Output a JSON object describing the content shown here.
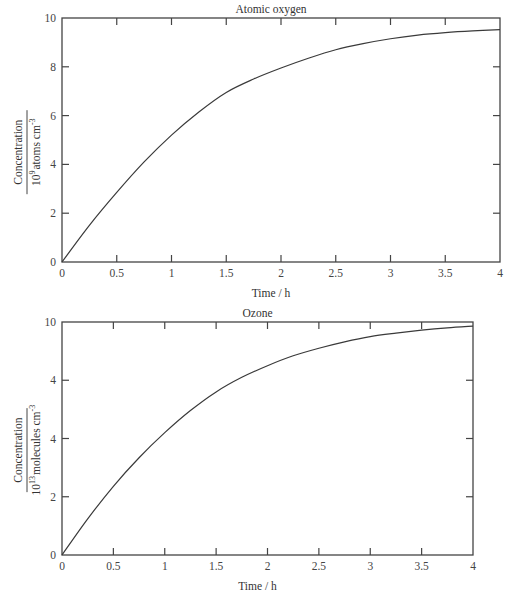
{
  "chart_data": [
    {
      "type": "line",
      "title": "Atomic oxygen",
      "xlabel": "Time / h",
      "ylabel_numerator": "Concentration",
      "ylabel_denominator": "10^9 atoms cm^-3",
      "ylabel_parts": {
        "base": "10",
        "exp": "9",
        "unit": "atoms cm",
        "unit_exp": "-3"
      },
      "xlim": [
        0,
        4
      ],
      "ylim": [
        0,
        10
      ],
      "x_ticks": [
        0,
        0.5,
        1,
        1.5,
        2,
        2.5,
        3,
        3.5,
        4
      ],
      "x_tick_labels": [
        "0",
        "0.5",
        "1",
        "1.5",
        "2",
        "2.5",
        "3",
        "3.5",
        "4"
      ],
      "y_ticks": [
        0,
        2,
        4,
        6,
        8,
        10
      ],
      "y_tick_labels": [
        "0",
        "2",
        "4",
        "6",
        "8",
        "10"
      ],
      "grid": false,
      "legend": null,
      "series": [
        {
          "name": "Atomic oxygen",
          "x": [
            0,
            0.25,
            0.5,
            0.75,
            1,
            1.25,
            1.5,
            1.75,
            2,
            2.25,
            2.5,
            2.75,
            3,
            3.25,
            3.5,
            3.75,
            4
          ],
          "y": [
            0,
            1.5,
            2.85,
            4.1,
            5.2,
            6.15,
            6.95,
            7.5,
            7.95,
            8.35,
            8.7,
            8.95,
            9.15,
            9.3,
            9.4,
            9.47,
            9.52
          ]
        }
      ]
    },
    {
      "type": "line",
      "title": "Ozone",
      "xlabel": "Time / h",
      "ylabel_numerator": "Concentration",
      "ylabel_denominator": "10^13 molecules cm^-3",
      "ylabel_parts": {
        "base": "10",
        "exp": "13",
        "unit": "molecules cm",
        "unit_exp": "-3"
      },
      "xlim": [
        0,
        4
      ],
      "ylim": [
        0,
        4
      ],
      "x_ticks": [
        0,
        0.5,
        1,
        1.5,
        2,
        2.5,
        3,
        3.5,
        4
      ],
      "x_tick_labels": [
        "0",
        "0.5",
        "1",
        "1.5",
        "2",
        "2.5",
        "3",
        "3.5",
        "4"
      ],
      "y_ticks": [
        0,
        1,
        2,
        3,
        4
      ],
      "y_tick_labels": [
        "0",
        "2",
        "4",
        "4",
        "10"
      ],
      "grid": false,
      "legend": null,
      "note": "y tick labels reproduced as printed (equally spaced ticks labelled 0, 2, 4, 4, 10)",
      "series": [
        {
          "name": "Ozone",
          "x": [
            0,
            0.25,
            0.5,
            0.75,
            1,
            1.25,
            1.5,
            1.75,
            2,
            2.25,
            2.5,
            2.75,
            3,
            3.25,
            3.5,
            3.75,
            4
          ],
          "y": [
            0,
            0.62,
            1.18,
            1.67,
            2.1,
            2.48,
            2.8,
            3.05,
            3.25,
            3.42,
            3.55,
            3.66,
            3.75,
            3.81,
            3.86,
            3.9,
            3.93
          ]
        }
      ]
    }
  ],
  "layout": {
    "panels": [
      {
        "left": 62,
        "top": 18,
        "right": 500,
        "bottom": 262
      },
      {
        "left": 62,
        "top": 322,
        "right": 473,
        "bottom": 555
      }
    ]
  }
}
